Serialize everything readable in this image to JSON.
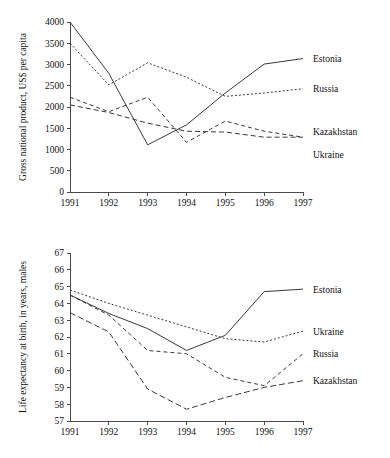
{
  "page": {
    "background": "#ffffff",
    "ink": "#1a1a1a"
  },
  "chart_data": [
    {
      "id": "gnp",
      "type": "line",
      "title": "",
      "xlabel": "",
      "ylabel": "Gross national product, US$ per capita",
      "x": [
        1991,
        1992,
        1993,
        1994,
        1995,
        1996,
        1997
      ],
      "xtick_labels": [
        "1991",
        "1992",
        "1993",
        "1994",
        "1995",
        "1996",
        "1997"
      ],
      "xlim": [
        1991,
        1997
      ],
      "ylim": [
        0,
        4000
      ],
      "ytick_values": [
        0,
        500,
        1000,
        1500,
        2000,
        2500,
        3000,
        3500,
        4000
      ],
      "ytick_labels": [
        "0",
        "500",
        "1000",
        "1500",
        "2000",
        "2500",
        "3000",
        "3500",
        "4000"
      ],
      "grid": false,
      "legend_position": "right-inline",
      "series": [
        {
          "name": "Estonia",
          "style": "solid",
          "dash": "none",
          "color": "#3a3a3a",
          "x": [
            1991,
            1992,
            1993,
            1994,
            1995,
            1996,
            1997
          ],
          "values": [
            4000,
            2790,
            1110,
            1580,
            2330,
            3010,
            3140
          ],
          "label_x": 1997,
          "label_y": 3140
        },
        {
          "name": "Russia",
          "style": "dotted",
          "dash": "2,2",
          "color": "#3a3a3a",
          "x": [
            1991,
            1992,
            1993,
            1994,
            1995,
            1996,
            1997
          ],
          "values": [
            3500,
            2520,
            3040,
            2700,
            2250,
            2330,
            2430
          ],
          "label_x": 1997,
          "label_y": 2430
        },
        {
          "name": "Kazakhstan",
          "style": "dashed",
          "dash": "5,3",
          "color": "#3a3a3a",
          "x": [
            1991,
            1992,
            1993,
            1994,
            1995,
            1996,
            1997
          ],
          "values": [
            2050,
            1870,
            1620,
            1430,
            1410,
            1290,
            1290
          ],
          "label_x": 1997,
          "label_y": 1430
        },
        {
          "name": "Ukraine",
          "style": "dashed-short",
          "dash": "4,3",
          "color": "#3a3a3a",
          "x": [
            1991,
            1992,
            1993,
            1994,
            1995,
            1996,
            1997
          ],
          "values": [
            2230,
            1890,
            2230,
            1170,
            1670,
            1430,
            1290
          ],
          "label_x": 1997,
          "label_y": 1170
        }
      ]
    },
    {
      "id": "life",
      "type": "line",
      "title": "",
      "xlabel": "",
      "ylabel": "Life expectancy at birth, in years, males",
      "x": [
        1991,
        1992,
        1993,
        1994,
        1995,
        1996,
        1997
      ],
      "xtick_labels": [
        "1991",
        "1992",
        "1993",
        "1994",
        "1995",
        "1996",
        "1997"
      ],
      "xlim": [
        1991,
        1997
      ],
      "ylim": [
        57,
        67
      ],
      "ytick_values": [
        57,
        58,
        59,
        60,
        61,
        62,
        63,
        64,
        65,
        66,
        67
      ],
      "ytick_labels": [
        "57",
        "58",
        "59",
        "60",
        "61",
        "62",
        "63",
        "64",
        "65",
        "66",
        "67"
      ],
      "grid": false,
      "legend_position": "right-inline",
      "series": [
        {
          "name": "Estonia",
          "style": "solid",
          "dash": "none",
          "color": "#3a3a3a",
          "x": [
            1991,
            1992,
            1993,
            1994,
            1995,
            1996,
            1997
          ],
          "values": [
            64.5,
            63.4,
            62.5,
            61.2,
            62.1,
            64.7,
            64.85
          ],
          "label_x": 1997,
          "label_y": 64.85
        },
        {
          "name": "Ukraine",
          "style": "dotted",
          "dash": "2,2",
          "color": "#3a3a3a",
          "x": [
            1991,
            1992,
            1993,
            1994,
            1995,
            1996,
            1997
          ],
          "values": [
            64.8,
            64.0,
            63.3,
            62.6,
            61.9,
            61.7,
            62.35
          ],
          "label_x": 1997,
          "label_y": 62.35
        },
        {
          "name": "Russia",
          "style": "dashed-short",
          "dash": "4,3",
          "color": "#3a3a3a",
          "x": [
            1991,
            1992,
            1993,
            1994,
            1995,
            1996,
            1997
          ],
          "values": [
            64.5,
            63.3,
            61.2,
            61.0,
            59.6,
            59.1,
            61.0
          ],
          "label_x": 1997,
          "label_y": 61.0
        },
        {
          "name": "Kazakhstan",
          "style": "dashed",
          "dash": "6,3",
          "color": "#3a3a3a",
          "x": [
            1991,
            1992,
            1993,
            1994,
            1995,
            1996,
            1997
          ],
          "values": [
            63.45,
            62.3,
            58.9,
            57.7,
            58.4,
            59.0,
            59.4
          ],
          "label_x": 1997,
          "label_y": 59.4
        }
      ]
    }
  ]
}
